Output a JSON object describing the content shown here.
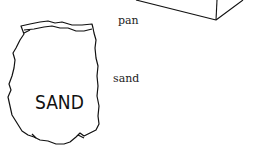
{
  "labels": {
    "pan": "pan",
    "sand": "sand"
  },
  "bag": {
    "text": "SAND"
  },
  "icons": [
    "pan-box-illustration",
    "sand-bag-illustration"
  ],
  "colors": {
    "line": "#111111",
    "background": "#ffffff"
  }
}
